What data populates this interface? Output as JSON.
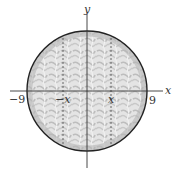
{
  "diagram": {
    "type": "circle-cross-section",
    "axes": {
      "x_label": "x",
      "y_label": "y"
    },
    "tick_labels": {
      "left": "−9",
      "right": "9",
      "neg_x": "−x",
      "pos_x": "x"
    },
    "circle": {
      "radius_units": 9,
      "fill": "#d9d9d9",
      "texture": "#bdbdbd",
      "stroke": "#222222"
    },
    "dashed_lines": [
      {
        "at": "-x"
      },
      {
        "at": "x"
      }
    ]
  }
}
